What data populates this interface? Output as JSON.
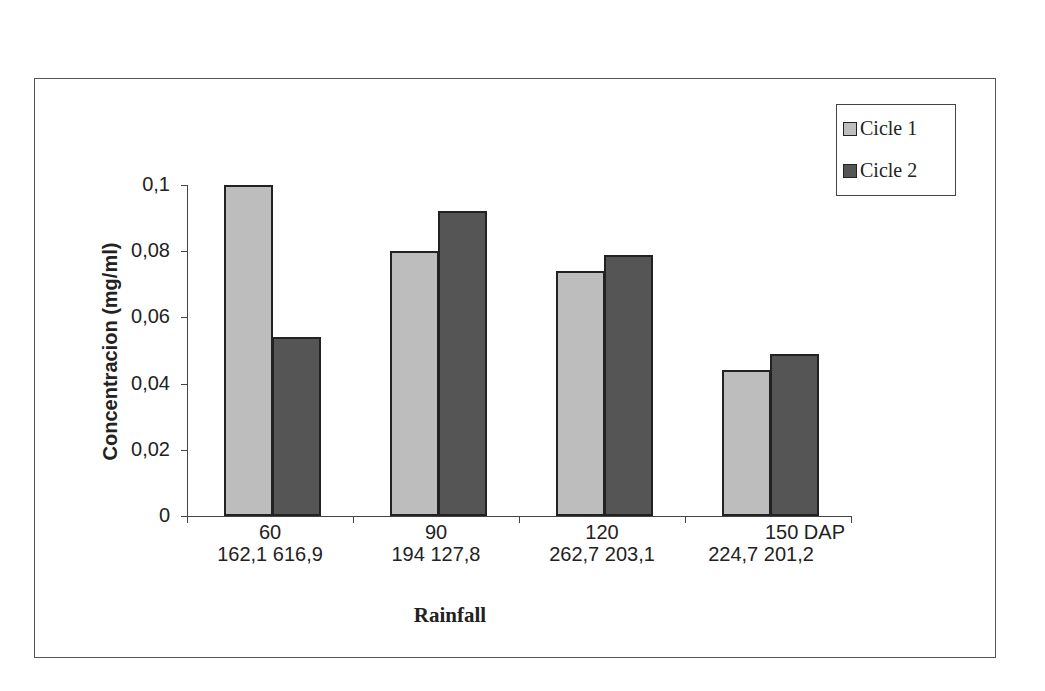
{
  "chart_data": {
    "type": "bar",
    "title": "",
    "xlabel": "Rainfall",
    "ylabel": "Concentracion (mg/ml)",
    "ylim": [
      0,
      0.1
    ],
    "yticks": [
      "0",
      "0,02",
      "0,04",
      "0,06",
      "0,08",
      "0,1"
    ],
    "grid": false,
    "legend_position": "top-right",
    "categories": [
      "60",
      "90",
      "120",
      "150 DAP"
    ],
    "category_sublabels": [
      "162,1  616,9",
      "194  127,8",
      "262,7  203,1",
      "224,7  201,2"
    ],
    "series": [
      {
        "name": "Cicle 1",
        "color": "#bdbdbd",
        "values": [
          0.1,
          0.08,
          0.074,
          0.044
        ]
      },
      {
        "name": "Cicle 2",
        "color": "#555555",
        "values": [
          0.054,
          0.092,
          0.079,
          0.049
        ]
      }
    ]
  },
  "legend": {
    "items": [
      "Cicle 1",
      "Cicle 2"
    ]
  }
}
